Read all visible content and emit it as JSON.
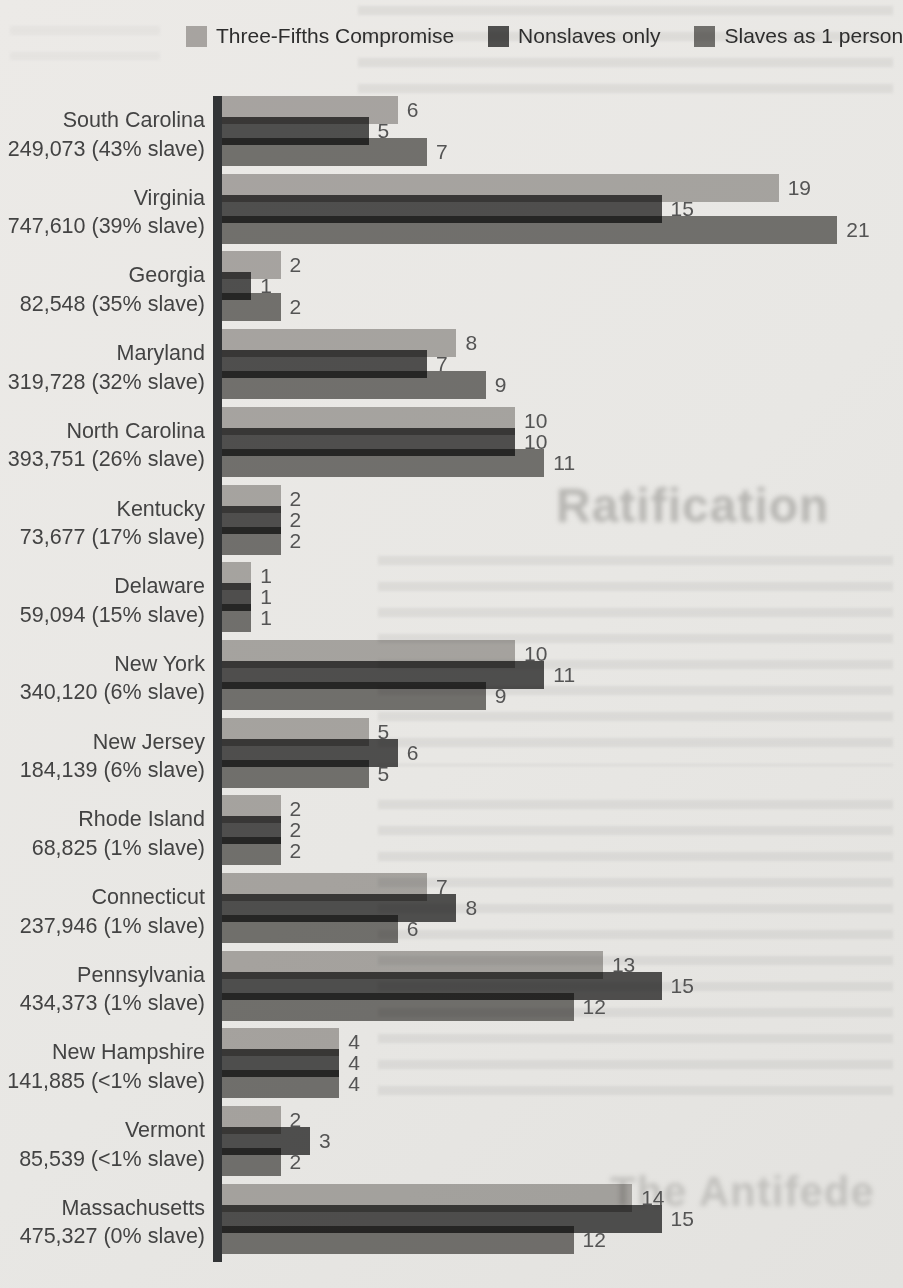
{
  "page": {
    "background_color": "#e8e7e4",
    "ghost_text": {
      "heading_mid": "Ratification",
      "heading_bottom": "The Antifede"
    }
  },
  "legend": {
    "items": [
      {
        "label": "Three-Fifths Compromise",
        "color": "#b5b3b1",
        "key": "three-fifths"
      },
      {
        "label": "Nonslaves only",
        "color": "#565656",
        "key": "nonslaves"
      },
      {
        "label": "Slaves as 1 person",
        "color": "#7b7a78",
        "key": "slaves-as-one"
      }
    ]
  },
  "chart_data": {
    "type": "bar",
    "orientation": "horizontal",
    "title": "",
    "xlabel": "",
    "ylabel": "",
    "value_unit": "House seats",
    "xlim": [
      0,
      21
    ],
    "grid": false,
    "legend_position": "top",
    "series_names": [
      "Three-Fifths Compromise",
      "Nonslaves only",
      "Slaves as 1 person"
    ],
    "axis_color": "#323436",
    "value_label_color": "#545454",
    "states": [
      {
        "name": "South Carolina",
        "stats": "249,073 (43% slave)",
        "values": [
          6,
          5,
          7
        ]
      },
      {
        "name": "Virginia",
        "stats": "747,610 (39% slave)",
        "values": [
          19,
          15,
          21
        ]
      },
      {
        "name": "Georgia",
        "stats": "82,548 (35% slave)",
        "values": [
          2,
          1,
          2
        ]
      },
      {
        "name": "Maryland",
        "stats": "319,728 (32% slave)",
        "values": [
          8,
          7,
          9
        ]
      },
      {
        "name": "North Carolina",
        "stats": "393,751 (26% slave)",
        "values": [
          10,
          10,
          11
        ]
      },
      {
        "name": "Kentucky",
        "stats": "73,677 (17% slave)",
        "values": [
          2,
          2,
          2
        ]
      },
      {
        "name": "Delaware",
        "stats": "59,094 (15% slave)",
        "values": [
          1,
          1,
          1
        ]
      },
      {
        "name": "New York",
        "stats": "340,120 (6% slave)",
        "values": [
          10,
          11,
          9
        ]
      },
      {
        "name": "New Jersey",
        "stats": "184,139 (6% slave)",
        "values": [
          5,
          6,
          5
        ]
      },
      {
        "name": "Rhode Island",
        "stats": "68,825 (1% slave)",
        "values": [
          2,
          2,
          2
        ]
      },
      {
        "name": "Connecticut",
        "stats": "237,946 (1% slave)",
        "values": [
          7,
          8,
          6
        ]
      },
      {
        "name": "Pennsylvania",
        "stats": "434,373 (1% slave)",
        "values": [
          13,
          15,
          12
        ]
      },
      {
        "name": "New Hampshire",
        "stats": "141,885 (<1% slave)",
        "values": [
          4,
          4,
          4
        ]
      },
      {
        "name": "Vermont",
        "stats": "85,539 (<1% slave)",
        "values": [
          2,
          3,
          2
        ]
      },
      {
        "name": "Massachusetts",
        "stats": "475,327 (0% slave)",
        "values": [
          14,
          15,
          12
        ]
      }
    ],
    "layout": {
      "px_per_unit": 29.3,
      "bar_height_px": 28,
      "bar_pitch_px": 21,
      "group_pitch_px": 77.7,
      "axis_x_px": 213,
      "bars_start_x_px": 222
    }
  }
}
